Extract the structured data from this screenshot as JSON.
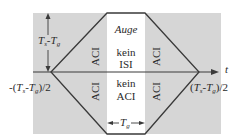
{
  "diagram": {
    "colors": {
      "background": "#ffffff",
      "shaded_region": "#d6d6d6",
      "eye_band": "#ffffff",
      "lines": "#3a3a3a"
    },
    "axis": {
      "t_label": "t",
      "left_tick": {
        "prefix": "-(",
        "a": "T",
        "a_sub": "s",
        "minus": "-",
        "b": "T",
        "b_sub": "g",
        "suffix": ")/2"
      },
      "right_tick": {
        "prefix": "(",
        "a": "T",
        "a_sub": "s",
        "minus": "-",
        "b": "T",
        "b_sub": "g",
        "suffix": ")/2"
      }
    },
    "height_label": {
      "a": "T",
      "a_sub": "s",
      "minus": "-",
      "b": "T",
      "b_sub": "g"
    },
    "center": {
      "title": "Auge",
      "upper_line1": "kein",
      "upper_line2": "ISI",
      "lower_line1": "kein",
      "lower_line2": "ACI"
    },
    "side_labels": [
      "ACI",
      "ACI",
      "ACI",
      "ACI"
    ],
    "width_label": {
      "a": "T",
      "a_sub": "g"
    }
  }
}
